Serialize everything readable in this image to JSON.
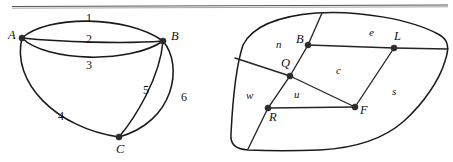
{
  "page": {
    "background_color": "#ffffff",
    "ink_color": "#1a1a1a",
    "width": 453,
    "height": 162
  },
  "rule": {
    "name": "horizontal-rule",
    "color": "#555555"
  },
  "left_figure": {
    "name": "multigraph-abc",
    "type": "graph",
    "vertices": [
      {
        "id": "A",
        "label": "A",
        "x": 22,
        "y": 38,
        "label_x": 8,
        "label_y": 29
      },
      {
        "id": "B",
        "label": "B",
        "x": 163,
        "y": 41,
        "label_x": 171,
        "label_y": 30
      },
      {
        "id": "C",
        "label": "C",
        "x": 119,
        "y": 137,
        "label_x": 116,
        "label_y": 143
      }
    ],
    "edges": [
      {
        "id": "1",
        "label": "1",
        "from": "A",
        "to": "B",
        "label_x": 86,
        "label_y": 12
      },
      {
        "id": "2",
        "label": "2",
        "from": "A",
        "to": "B",
        "label_x": 86,
        "label_y": 34
      },
      {
        "id": "3",
        "label": "3",
        "from": "A",
        "to": "B",
        "label_x": 86,
        "label_y": 59
      },
      {
        "id": "4",
        "label": "4",
        "from": "A",
        "to": "C",
        "label_x": 58,
        "label_y": 111
      },
      {
        "id": "5",
        "label": "5",
        "from": "B",
        "to": "C",
        "label_x": 143,
        "label_y": 85
      },
      {
        "id": "6",
        "label": "6",
        "from": "B",
        "to": "C",
        "label_x": 180,
        "label_y": 92
      }
    ]
  },
  "right_figure": {
    "name": "planar-subdivision-bqrfl",
    "type": "planar-subdivision",
    "vertices": [
      {
        "id": "B",
        "label": "B",
        "x": 308,
        "y": 45,
        "label_x": 296,
        "label_y": 34
      },
      {
        "id": "L",
        "label": "L",
        "x": 394,
        "y": 48,
        "label_x": 394,
        "label_y": 31
      },
      {
        "id": "Q",
        "label": "Q",
        "x": 290,
        "y": 76,
        "label_x": 282,
        "label_y": 58
      },
      {
        "id": "R",
        "label": "R",
        "x": 268,
        "y": 108,
        "label_x": 269,
        "label_y": 112
      },
      {
        "id": "F",
        "label": "F",
        "x": 355,
        "y": 107,
        "label_x": 360,
        "label_y": 106
      }
    ],
    "regions": [
      {
        "id": "n",
        "label": "n",
        "label_x": 276,
        "label_y": 40
      },
      {
        "id": "e",
        "label": "e",
        "label_x": 369,
        "label_y": 27
      },
      {
        "id": "c",
        "label": "c",
        "label_x": 336,
        "label_y": 66
      },
      {
        "id": "s",
        "label": "s",
        "label_x": 392,
        "label_y": 87
      },
      {
        "id": "w",
        "label": "w",
        "label_x": 246,
        "label_y": 91
      },
      {
        "id": "u",
        "label": "u",
        "label_x": 294,
        "label_y": 90
      }
    ]
  }
}
